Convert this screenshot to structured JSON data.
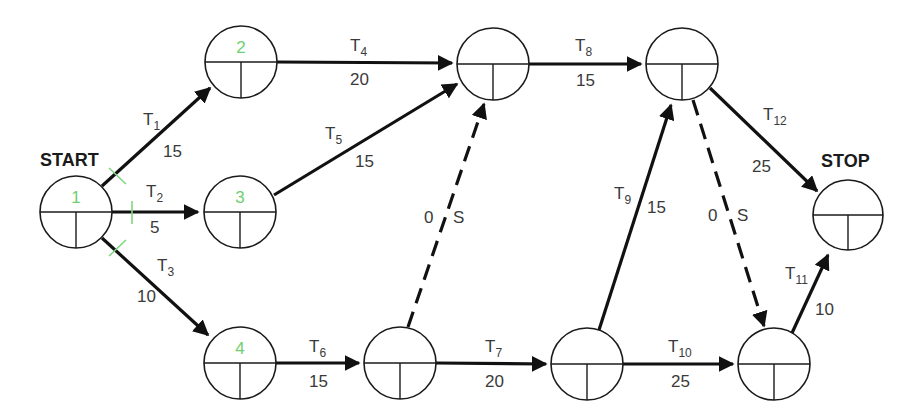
{
  "diagram": {
    "type": "activity-on-arrow network",
    "terminals": {
      "start": "START",
      "stop": "STOP"
    },
    "nodes": [
      {
        "id": "n1",
        "number": "1",
        "cx": 76,
        "cy": 212,
        "r": 36
      },
      {
        "id": "n2",
        "number": "2",
        "cx": 241,
        "cy": 62,
        "r": 36
      },
      {
        "id": "n3",
        "number": "3",
        "cx": 240,
        "cy": 212,
        "r": 36
      },
      {
        "id": "n4",
        "number": "4",
        "cx": 240,
        "cy": 363,
        "r": 36
      },
      {
        "id": "n5",
        "number": "",
        "cx": 493,
        "cy": 64,
        "r": 36
      },
      {
        "id": "n6",
        "number": "",
        "cx": 682,
        "cy": 64,
        "r": 36
      },
      {
        "id": "n7",
        "number": "",
        "cx": 400,
        "cy": 363,
        "r": 36
      },
      {
        "id": "n8",
        "number": "",
        "cx": 587,
        "cy": 364,
        "r": 36
      },
      {
        "id": "n9",
        "number": "",
        "cx": 774,
        "cy": 364,
        "r": 36
      },
      {
        "id": "n10",
        "number": "",
        "cx": 848,
        "cy": 215,
        "r": 36
      }
    ],
    "tasks": [
      {
        "name": "T",
        "sub": "1",
        "duration": "15",
        "from": "n1",
        "to": "n2"
      },
      {
        "name": "T",
        "sub": "2",
        "duration": "5",
        "from": "n1",
        "to": "n3"
      },
      {
        "name": "T",
        "sub": "3",
        "duration": "10",
        "from": "n1",
        "to": "n4"
      },
      {
        "name": "T",
        "sub": "4",
        "duration": "20",
        "from": "n2",
        "to": "n5"
      },
      {
        "name": "T",
        "sub": "5",
        "duration": "15",
        "from": "n3",
        "to": "n5"
      },
      {
        "name": "T",
        "sub": "6",
        "duration": "15",
        "from": "n4",
        "to": "n7"
      },
      {
        "name": "T",
        "sub": "7",
        "duration": "20",
        "from": "n7",
        "to": "n8"
      },
      {
        "name": "T",
        "sub": "8",
        "duration": "15",
        "from": "n5",
        "to": "n6"
      },
      {
        "name": "T",
        "sub": "9",
        "duration": "15",
        "from": "n8",
        "to": "n6"
      },
      {
        "name": "T",
        "sub": "10",
        "duration": "25",
        "from": "n8",
        "to": "n9"
      },
      {
        "name": "T",
        "sub": "11",
        "duration": "10",
        "from": "n9",
        "to": "n10"
      },
      {
        "name": "T",
        "sub": "12",
        "duration": "25",
        "from": "n6",
        "to": "n10"
      }
    ],
    "dummies": [
      {
        "duration": "0",
        "label": "S",
        "from": "n7",
        "to": "n5"
      },
      {
        "duration": "0",
        "label": "S",
        "from": "n6",
        "to": "n9"
      }
    ],
    "colors": {
      "line": "#111111",
      "node_number": "#6fcf6f",
      "tick": "#7fd77f",
      "label": "#3a3a3a"
    }
  }
}
